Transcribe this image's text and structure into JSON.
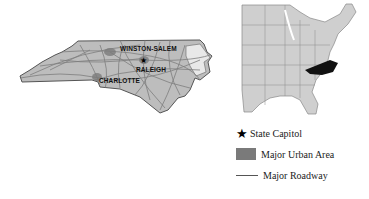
{
  "nc_map": {
    "title": "North Carolina",
    "fill_color": "#bdbdbd",
    "road_color": "#7e7e7e",
    "cities": [
      {
        "name": "WINSTON-SALEM"
      },
      {
        "name": "RALEIGH",
        "is_capitol": true
      },
      {
        "name": "CHARLOTTE"
      }
    ]
  },
  "us_map": {
    "title": "Eastern United States",
    "state_fill": "#cfcfcf",
    "highlight_state": "North Carolina",
    "highlight_color": "#111111"
  },
  "legend": {
    "items": [
      {
        "icon": "star-icon",
        "label": "State Capitol"
      },
      {
        "icon": "urban-area-swatch",
        "label": "Major Urban Area",
        "color": "#7a7a7a"
      },
      {
        "icon": "roadway-line",
        "label": "Major Roadway",
        "color": "#555555"
      }
    ]
  }
}
